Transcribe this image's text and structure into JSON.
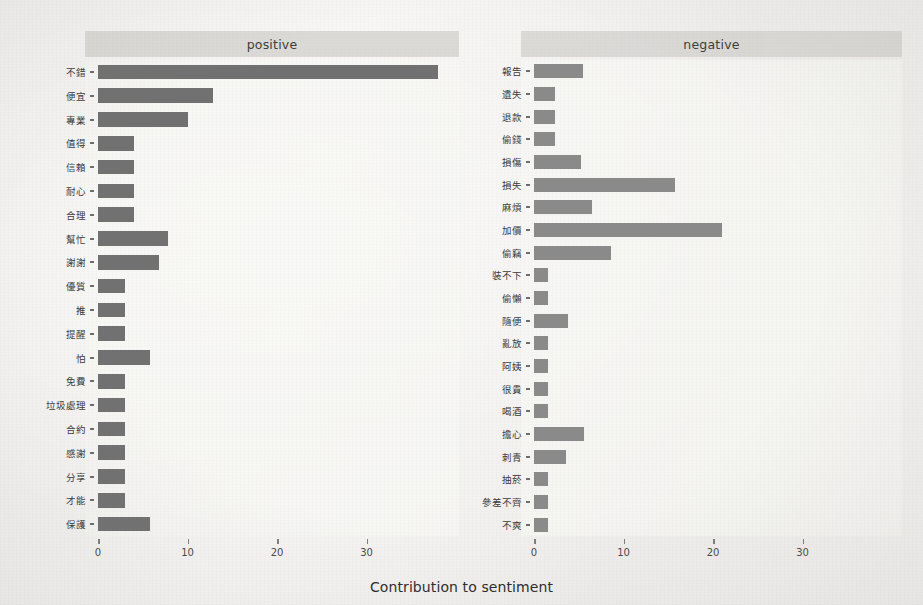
{
  "figure": {
    "xlabel": "Contribution to sentiment",
    "panel_positive_label": "positive",
    "panel_negative_label": "negative"
  },
  "axis": {
    "ticks": [
      "0",
      "10",
      "20",
      "30"
    ],
    "tick_values": [
      0,
      10,
      20,
      30
    ],
    "xlim": [
      0,
      40
    ]
  },
  "chart_data": {
    "type": "bar",
    "orientation": "horizontal",
    "title": "",
    "xlabel": "Contribution to sentiment",
    "ylabel": "",
    "xlim": [
      0,
      40
    ],
    "xticks": [
      0,
      10,
      20,
      30
    ],
    "grid": false,
    "legend": "none",
    "facets": [
      {
        "name": "positive",
        "categories": [
          "不錯",
          "便宜",
          "專業",
          "值得",
          "信賴",
          "耐心",
          "合理",
          "幫忙",
          "謝謝",
          "優質",
          "推",
          "提醒",
          "怕",
          "免費",
          "垃圾處理",
          "合約",
          "感謝",
          "分享",
          "才能",
          "保護"
        ],
        "values": [
          38.0,
          12.8,
          10.0,
          4.0,
          4.0,
          4.0,
          4.0,
          7.8,
          6.8,
          3.0,
          3.0,
          3.0,
          5.8,
          3.0,
          3.0,
          3.0,
          3.0,
          3.0,
          3.0,
          5.8
        ]
      },
      {
        "name": "negative",
        "categories": [
          "報告",
          "遺失",
          "退款",
          "偷錢",
          "損傷",
          "損失",
          "麻煩",
          "加價",
          "偷竊",
          "裝不下",
          "偷懶",
          "隨便",
          "亂放",
          "阿姨",
          "很貴",
          "喝酒",
          "擔心",
          "刺青",
          "抽菸",
          "參差不齊",
          "不爽"
        ],
        "values": [
          5.5,
          2.4,
          2.4,
          2.4,
          5.3,
          15.7,
          6.5,
          21.0,
          8.6,
          1.6,
          1.6,
          3.8,
          1.6,
          1.6,
          1.6,
          1.6,
          5.6,
          3.6,
          1.6,
          1.6,
          1.6
        ]
      }
    ]
  },
  "colors": {
    "bar_positive": "#5e5e5e",
    "bar_negative": "#6f6f6f",
    "strip_background": "#d9d8d5",
    "page_background": "#f4f3f1",
    "text": "#2e2e2e"
  }
}
